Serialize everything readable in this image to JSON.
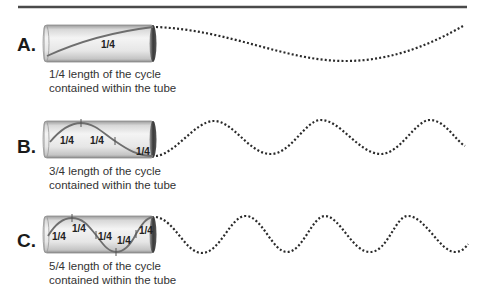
{
  "figure": {
    "rows": [
      {
        "id": "A",
        "label": "A.",
        "cycles_in_tube": 0.25,
        "segment_labels": [
          "1/4"
        ],
        "caption_line1": "1/4 length of the cycle",
        "caption_line2": "contained within the tube"
      },
      {
        "id": "B",
        "label": "B.",
        "cycles_in_tube": 0.75,
        "segment_labels": [
          "1/4",
          "1/4",
          "1/4"
        ],
        "caption_line1": "3/4 length of the cycle",
        "caption_line2": "contained within the tube"
      },
      {
        "id": "C",
        "label": "C.",
        "cycles_in_tube": 1.25,
        "segment_labels": [
          "1/4",
          "1/4",
          "1/4",
          "1/4",
          "1/4"
        ],
        "caption_line1": "5/4 length of the cycle",
        "caption_line2": "contained within the tube"
      }
    ],
    "colors": {
      "rule": "#4a4a4a",
      "wave_inside": "#6e6e6e",
      "wave_dotted": "#2a2a2a",
      "tube_body": "#e9e9e9",
      "tube_edge": "#7a7a7a",
      "tube_cap": "#3c3c3c"
    }
  }
}
